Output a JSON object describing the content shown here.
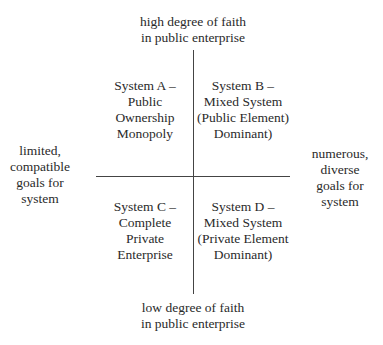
{
  "axes": {
    "top": [
      "high degree of faith",
      "in public enterprise"
    ],
    "bottom": [
      "low degree of faith",
      "in public enterprise"
    ],
    "left": [
      "limited,",
      "compatible",
      "goals for",
      "system"
    ],
    "right": [
      "numerous,",
      "diverse",
      "goals for",
      "system"
    ]
  },
  "quadrants": {
    "a": [
      "System A –",
      "Public",
      "Ownership",
      "Monopoly"
    ],
    "b": [
      "System B –",
      "Mixed System",
      "(Public Element)",
      "Dominant)"
    ],
    "c": [
      "System C –",
      "Complete",
      "Private",
      "Enterprise"
    ],
    "d": [
      "System D –",
      "Mixed System",
      "(Private Element",
      "Dominant)"
    ]
  }
}
